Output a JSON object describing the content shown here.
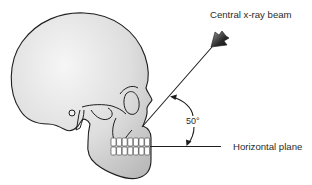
{
  "figure": {
    "type": "anatomical-diagram",
    "labels": {
      "beam": "Central x-ray beam",
      "plane": "Horizontal plane",
      "angle": "50°"
    },
    "angle_degrees": 50,
    "colors": {
      "outline": "#1e1e1e",
      "skull_fill_light": "#f4f4f4",
      "skull_fill_dark": "#bdbdbd",
      "teeth": "#ffffff",
      "arrowhead_dark": "#1a1a1a",
      "arrowhead_light": "#8a8a8a",
      "text": "#2b2b2b"
    }
  }
}
